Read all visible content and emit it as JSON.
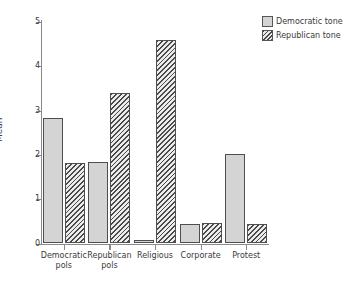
{
  "chart_data": {
    "type": "bar",
    "title": "",
    "xlabel": "",
    "ylabel": "Mean",
    "ylim": [
      0,
      5.2
    ],
    "yticks": [
      0,
      1,
      2,
      3,
      4,
      5
    ],
    "ytick_labels": [
      "0",
      "1",
      "2",
      "3",
      "4",
      "5"
    ],
    "grid": false,
    "legend_position": "top-right",
    "categories": [
      "Democratic pols",
      "Republican pols",
      "Religious",
      "Corporate",
      "Protest"
    ],
    "category_labels": [
      "Democratic\npols",
      "Republican\npols",
      "Religious",
      "Corporate",
      "Protest"
    ],
    "series": [
      {
        "name": "Democratic tone",
        "fill": "solid",
        "color": "#d4d4d4",
        "values": [
          2.84,
          1.85,
          0.08,
          0.43,
          2.03
        ]
      },
      {
        "name": "Republican tone",
        "fill": "diagonal-hatch",
        "color": "#4a4a4a",
        "values": [
          1.82,
          3.4,
          4.59,
          0.47,
          0.43
        ]
      }
    ]
  },
  "legend": {
    "items": [
      {
        "label": "Democratic tone",
        "swatch": "legend-swatch-solid-icon"
      },
      {
        "label": "Republican tone",
        "swatch": "legend-swatch-hatch-icon"
      }
    ]
  },
  "axes": {
    "y_title": "Mean"
  }
}
